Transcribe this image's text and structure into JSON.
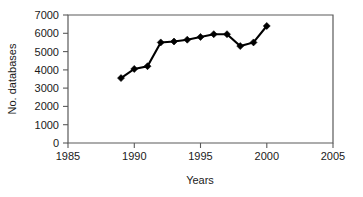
{
  "chart_data": {
    "type": "line",
    "title": "",
    "xlabel": "Years",
    "ylabel": "No. databases",
    "x": [
      1989,
      1990,
      1991,
      1992,
      1993,
      1994,
      1995,
      1996,
      1997,
      1998,
      1999,
      2000
    ],
    "values": [
      3550,
      4050,
      4200,
      5500,
      5550,
      5650,
      5800,
      5950,
      5950,
      5300,
      5500,
      6400
    ],
    "series": [
      {
        "name": "No. databases",
        "values": [
          3550,
          4050,
          4200,
          5500,
          5550,
          5650,
          5800,
          5950,
          5950,
          5300,
          5500,
          6400
        ]
      }
    ],
    "xlim": [
      1985,
      2005
    ],
    "ylim": [
      0,
      7000
    ],
    "xticks": [
      1985,
      1990,
      1995,
      2000,
      2005
    ],
    "xtick_labels": [
      "1985",
      "1990",
      "1995",
      "2000",
      "2005"
    ],
    "yticks": [
      0,
      1000,
      2000,
      3000,
      4000,
      5000,
      6000,
      7000
    ],
    "ytick_labels": [
      "0",
      "1000",
      "2000",
      "3000",
      "4000",
      "5000",
      "6000",
      "7000"
    ],
    "grid": false,
    "legend": false,
    "legend_position": "none",
    "marker": "diamond",
    "line_color": "#000000",
    "marker_color": "#000000",
    "background_color": "#ffffff",
    "axis_color": "#5a5a5a"
  },
  "axes": {
    "y_title": "No. databases",
    "x_title": "Years"
  },
  "ticks": {
    "y": [
      "7000",
      "6000",
      "5000",
      "4000",
      "3000",
      "2000",
      "1000",
      "0"
    ],
    "x": [
      "1985",
      "1990",
      "1995",
      "2000",
      "2005"
    ]
  }
}
